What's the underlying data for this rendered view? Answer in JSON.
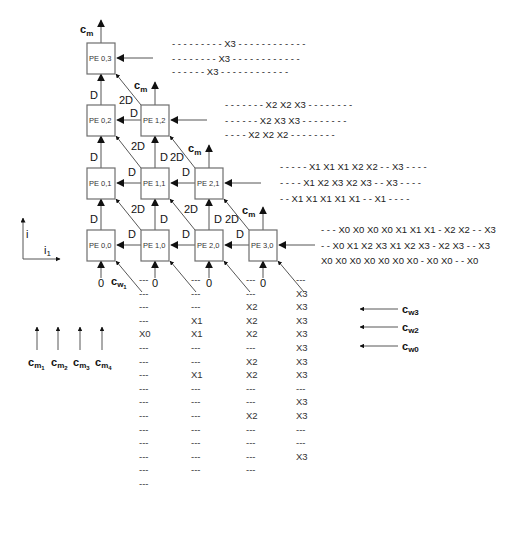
{
  "diagram": {
    "pe_grid": [
      {
        "id": "pe-0-3",
        "label": "PE 0,3",
        "x": 87,
        "y": 43
      },
      {
        "id": "pe-0-2",
        "label": "PE 0,2",
        "x": 87,
        "y": 105
      },
      {
        "id": "pe-1-2",
        "label": "PE 1,2",
        "x": 141,
        "y": 105
      },
      {
        "id": "pe-0-1",
        "label": "PE 0,1",
        "x": 87,
        "y": 168
      },
      {
        "id": "pe-1-1",
        "label": "PE 1,1",
        "x": 141,
        "y": 168
      },
      {
        "id": "pe-2-1",
        "label": "PE 2,1",
        "x": 195,
        "y": 168
      },
      {
        "id": "pe-0-0",
        "label": "PE 0,0",
        "x": 87,
        "y": 230
      },
      {
        "id": "pe-1-0",
        "label": "PE 1,0",
        "x": 141,
        "y": 230
      },
      {
        "id": "pe-2-0",
        "label": "PE 2,0",
        "x": 195,
        "y": 230
      },
      {
        "id": "pe-3-0",
        "label": "PE 3,0",
        "x": 249,
        "y": 230
      }
    ],
    "labels": {
      "cm": "c",
      "cm_sub": "m",
      "delay": "D",
      "delay2": "2D",
      "zero": "0",
      "cw1": "c",
      "cw1_sub": "w",
      "cw1_subsub": "1",
      "axis_i": "i",
      "axis_i1": "i",
      "axis_i1_sub": "1"
    },
    "input_streams": {
      "row3": [
        "- - - - - - - - - X3 - - - - - - - - - - - -",
        "- - - - - - - - X3 - - - - - - - - - - - -",
        "- - - - - - X3 - - - - - - - - - - - -"
      ],
      "row2": [
        "- - - - - - - X2 X2 X3 - - - - - - - -",
        "- - - - - - X2 X3 X3 - - - - - - - -",
        "- - - - X2 X2 X2 - - - - - - - -"
      ],
      "row1": [
        "- - - - - X1 X1 X1 X2 X2 - - X3 - - - -",
        "- - - - X1 X2 X3 X2 X3 - - X3 - - - -",
        "- - X1 X1 X1 X1 X1 - - X1 - - - -"
      ],
      "row0": [
        "- - - X0 X0 X0 X0 X1 X1 X1 - X2 X2 - - X3",
        "- - X0 X1 X2 X3 X1 X2 X3 - X2 X3 - - X3",
        "X0 X0 X0 X0 X0 X0 X0 - X0 X0 - - X0"
      ]
    },
    "weight_inputs": [
      {
        "name": "c",
        "sub": "w3"
      },
      {
        "name": "c",
        "sub": "w2"
      },
      {
        "name": "c",
        "sub": "w0"
      }
    ],
    "output_labels": [
      {
        "name": "c",
        "sub": "m",
        "subsub": "1"
      },
      {
        "name": "c",
        "sub": "m",
        "subsub": "2"
      },
      {
        "name": "c",
        "sub": "m",
        "subsub": "3"
      },
      {
        "name": "c",
        "sub": "m",
        "subsub": "4"
      }
    ],
    "columns": [
      {
        "x": 145,
        "values": [
          "---",
          "---",
          "---",
          "---",
          "X0",
          "---",
          "---",
          "---",
          "---",
          "---",
          "---",
          "---",
          "---",
          "---",
          "---",
          "---"
        ]
      },
      {
        "x": 197,
        "values": [
          "---",
          "---",
          "---",
          "X1",
          "X1",
          "---",
          "---",
          "X1",
          "---",
          "---",
          "---",
          "---",
          "---",
          "---",
          "---"
        ]
      },
      {
        "x": 252,
        "values": [
          "---",
          "---",
          "X2",
          "X2",
          "X2",
          "---",
          "X2",
          "X2",
          "---",
          "---",
          "X2",
          "---",
          "---",
          "---",
          "---"
        ]
      },
      {
        "x": 302,
        "values": [
          "---",
          "X3",
          "X3",
          "X3",
          "X3",
          "X3",
          "X3",
          "X3",
          "---",
          "X3",
          "X3",
          "---",
          "---",
          "X3"
        ]
      }
    ]
  }
}
